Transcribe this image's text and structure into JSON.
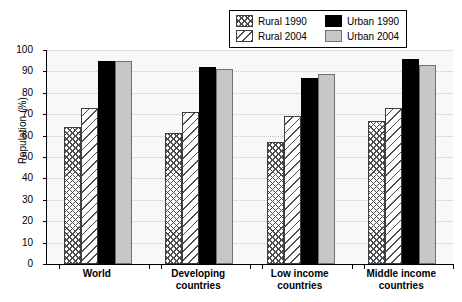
{
  "chart_data": {
    "type": "bar",
    "title": "",
    "xlabel": "",
    "ylabel": "Population (%)",
    "ylim": [
      0,
      100
    ],
    "yticks": [
      0,
      10,
      20,
      30,
      40,
      50,
      60,
      70,
      80,
      90,
      100
    ],
    "grid": true,
    "legend_position": "top-right",
    "categories": [
      "World",
      "Developing countries",
      "Low income countries",
      "Middle income countries"
    ],
    "category_lines": [
      [
        "World"
      ],
      [
        "Developing",
        "countries"
      ],
      [
        "Low income",
        "countries"
      ],
      [
        "Middle income",
        "countries"
      ]
    ],
    "series": [
      {
        "name": "Rural 1990",
        "pattern": "cross-hatch",
        "color": "#ffffff",
        "values": [
          64,
          61,
          57,
          67
        ]
      },
      {
        "name": "Rural 2004",
        "pattern": "diagonal-hatch",
        "color": "#ffffff",
        "values": [
          73,
          71,
          69,
          73
        ]
      },
      {
        "name": "Urban 1990",
        "pattern": "solid",
        "color": "#000000",
        "values": [
          95,
          92,
          87,
          96
        ]
      },
      {
        "name": "Urban 2004",
        "pattern": "solid",
        "color": "#c5c7c8",
        "values": [
          95,
          91,
          89,
          93
        ]
      }
    ]
  }
}
